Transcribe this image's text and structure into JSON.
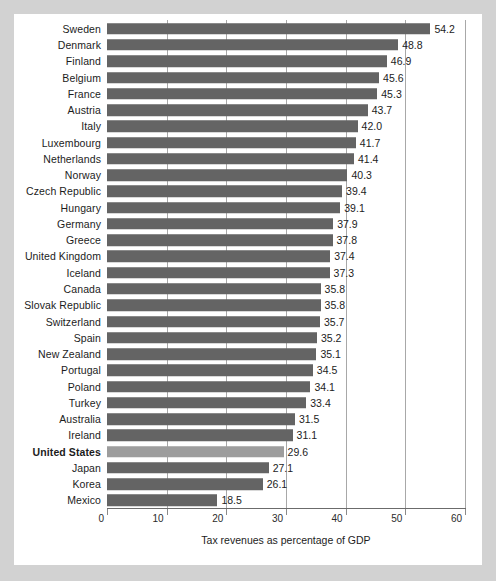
{
  "chart_data": {
    "type": "bar",
    "orientation": "horizontal",
    "title": "",
    "xlabel": "Tax revenues as percentage of GDP",
    "ylabel": "",
    "xlim": [
      0,
      60
    ],
    "xticks": [
      0,
      10,
      20,
      30,
      40,
      50,
      60
    ],
    "xtick_labels": [
      "0",
      "10",
      "20",
      "30",
      "40",
      "50",
      "60"
    ],
    "grid": true,
    "grid_axis": "x",
    "legend": false,
    "bar_color": "#646464",
    "highlight_color": "#9d9d9d",
    "highlight_category": "United States",
    "categories": [
      "Sweden",
      "Denmark",
      "Finland",
      "Belgium",
      "France",
      "Austria",
      "Italy",
      "Luxembourg",
      "Netherlands",
      "Norway",
      "Czech Republic",
      "Hungary",
      "Germany",
      "Greece",
      "United Kingdom",
      "Iceland",
      "Canada",
      "Slovak Republic",
      "Switzerland",
      "Spain",
      "New Zealand",
      "Portugal",
      "Poland",
      "Turkey",
      "Australia",
      "Ireland",
      "United States",
      "Japan",
      "Korea",
      "Mexico"
    ],
    "values": [
      54.2,
      48.8,
      46.9,
      45.6,
      45.3,
      43.7,
      42.0,
      41.7,
      41.4,
      40.3,
      39.4,
      39.1,
      37.9,
      37.8,
      37.4,
      37.3,
      35.8,
      35.8,
      35.7,
      35.2,
      35.1,
      34.5,
      34.1,
      33.4,
      31.5,
      31.1,
      29.6,
      27.1,
      26.1,
      18.5
    ],
    "value_labels": [
      "54.2",
      "48.8",
      "46.9",
      "45.6",
      "45.3",
      "43.7",
      "42.0",
      "41.7",
      "41.4",
      "40.3",
      "39.4",
      "39.1",
      "37.9",
      "37.8",
      "37.4",
      "37.3",
      "35.8",
      "35.8",
      "35.7",
      "35.2",
      "35.1",
      "34.5",
      "34.1",
      "33.4",
      "31.5",
      "31.1",
      "29.6",
      "27.1",
      "26.1",
      "18.5"
    ]
  }
}
